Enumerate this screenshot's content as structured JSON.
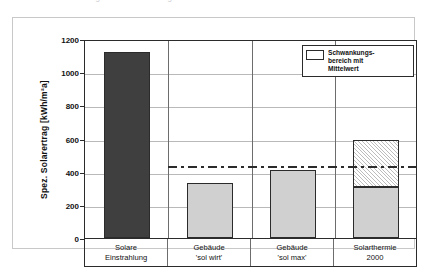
{
  "top_sliver": {
    "ghost_text": "Bild  Abb.   Diagramm   Solarertrag"
  },
  "legend": {
    "swatch_name": "range-swatch",
    "lines": [
      "Schwankungs-",
      "bereich mit",
      "Mittelwert"
    ]
  },
  "chart_data": {
    "type": "bar",
    "title": "",
    "xlabel": "",
    "ylabel": "Spez. Solarertrag [kWh/m²a]",
    "ylim": [
      0,
      1200
    ],
    "ytick_step": 200,
    "yticks": [
      0,
      200,
      400,
      600,
      800,
      1000,
      1200
    ],
    "ytick_labels": [
      "0",
      "200",
      "400",
      "600",
      "800",
      "1000",
      "1200"
    ],
    "grid": true,
    "legend_position": "top-right",
    "categories": [
      "Solare\nEinstrahlung",
      "Gebäude\n'sol wirt'",
      "Gebäude\n'sol max'",
      "Solarthermie\n2000"
    ],
    "category_lines": [
      [
        "Solare",
        "Einstrahlung"
      ],
      [
        "Gebäude",
        "'sol wirt'"
      ],
      [
        "Gebäude",
        "'sol max'"
      ],
      [
        "Solarthermie",
        "2000"
      ]
    ],
    "values": [
      1120,
      330,
      410,
      310
    ],
    "bars": [
      {
        "category": "Solare Einstrahlung",
        "value": 1120,
        "style": "dark",
        "range_top": null
      },
      {
        "category": "Gebäude 'sol wirt'",
        "value": 330,
        "style": "light",
        "range_top": null
      },
      {
        "category": "Gebäude 'sol max'",
        "value": 410,
        "style": "light",
        "range_top": null
      },
      {
        "category": "Solarthermie 2000",
        "value": 310,
        "style": "light",
        "range_top": 590
      }
    ],
    "mean_line": {
      "label": "Mittelwert",
      "value": 440,
      "style": "dash-dot",
      "spans_categories": [
        "Gebäude 'sol wirt'",
        "Gebäude 'sol max'",
        "Solarthermie 2000"
      ]
    },
    "annotations": [
      {
        "text": "Schwankungsbereich mit Mittelwert",
        "target": "Solarthermie 2000"
      }
    ]
  },
  "colors": {
    "bar_dark": "#3f3f3f",
    "bar_light": "#d0d0d0",
    "hatch": "#bdbdbd",
    "axis": "#2b2b2b",
    "grid": "#b9b9b9",
    "separator": "#6d6d6d",
    "card_border": "#c8c8c8",
    "background": "#ffffff"
  }
}
